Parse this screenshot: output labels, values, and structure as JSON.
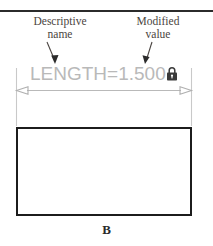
{
  "figure": {
    "letter": "B",
    "top_rule_color": "#2b2b2b"
  },
  "annotations": [
    {
      "name": "descriptive-name",
      "line1": "Descriptive",
      "line2": "name",
      "leader": "arrow-down-right"
    },
    {
      "name": "modified-value",
      "line1": "Modified",
      "line2": "value",
      "leader": "arrow-down-left"
    }
  ],
  "dimension": {
    "parameter_name": "LENGTH",
    "operator": "=",
    "value": "1.500",
    "full_text": "LENGTH=1.500",
    "text_color": "#b9b9b9",
    "locked": true,
    "lock_icon": "padlock-icon",
    "lock_color": "#3a3a3a",
    "extension_line_color": "#c9c9c9",
    "dimension_line_color": "#b9b9b9",
    "arrowhead_style": "open"
  },
  "shape": {
    "name": "rectangle",
    "stroke_color": "#1c1c1c",
    "fill_color": "#ffffff"
  }
}
